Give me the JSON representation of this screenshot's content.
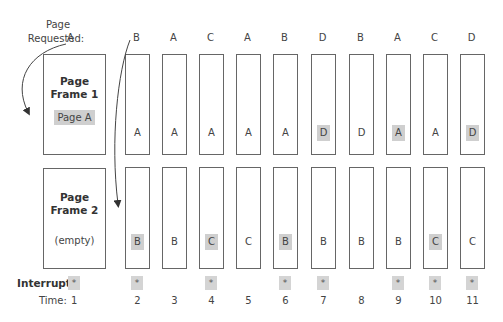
{
  "labels": {
    "page_requested_line1": "Page",
    "page_requested_line2": "Requested:",
    "interrupt": "Interrupt:",
    "time": "Time:"
  },
  "frames": {
    "frame1": {
      "title_line1": "Page",
      "title_line2": "Frame 1",
      "content": "Page A"
    },
    "frame2": {
      "title_line1": "Page",
      "title_line2": "Frame 2",
      "content": "(empty)"
    }
  },
  "first_request": "A",
  "first_time": "1",
  "interrupt_mark": "*",
  "columns": [
    {
      "time": "2",
      "request": "B",
      "frame1": "A",
      "frame1_hl": false,
      "frame2": "B",
      "frame2_hl": true,
      "interrupt": true
    },
    {
      "time": "3",
      "request": "A",
      "frame1": "A",
      "frame1_hl": false,
      "frame2": "B",
      "frame2_hl": false,
      "interrupt": false
    },
    {
      "time": "4",
      "request": "C",
      "frame1": "A",
      "frame1_hl": false,
      "frame2": "C",
      "frame2_hl": true,
      "interrupt": true
    },
    {
      "time": "5",
      "request": "A",
      "frame1": "A",
      "frame1_hl": false,
      "frame2": "C",
      "frame2_hl": false,
      "interrupt": false
    },
    {
      "time": "6",
      "request": "B",
      "frame1": "A",
      "frame1_hl": false,
      "frame2": "B",
      "frame2_hl": true,
      "interrupt": true
    },
    {
      "time": "7",
      "request": "D",
      "frame1": "D",
      "frame1_hl": true,
      "frame2": "B",
      "frame2_hl": false,
      "interrupt": true
    },
    {
      "time": "8",
      "request": "B",
      "frame1": "D",
      "frame1_hl": false,
      "frame2": "B",
      "frame2_hl": false,
      "interrupt": false
    },
    {
      "time": "9",
      "request": "A",
      "frame1": "A",
      "frame1_hl": true,
      "frame2": "B",
      "frame2_hl": false,
      "interrupt": true
    },
    {
      "time": "10",
      "request": "C",
      "frame1": "A",
      "frame1_hl": false,
      "frame2": "C",
      "frame2_hl": true,
      "interrupt": true
    },
    {
      "time": "11",
      "request": "D",
      "frame1": "D",
      "frame1_hl": true,
      "frame2": "C",
      "frame2_hl": false,
      "interrupt": true
    }
  ],
  "colors": {
    "border": "#666666",
    "highlight": "#cfcfcf",
    "text": "#444444"
  }
}
